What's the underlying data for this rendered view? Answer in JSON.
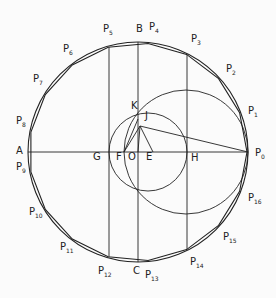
{
  "diagram": {
    "stroke_color": "#222222",
    "background": "#fbfbfb",
    "main_circle": {
      "cx": 138,
      "cy": 152,
      "r": 110
    },
    "circle_E": {
      "cx": 148,
      "cy": 152,
      "r": 39
    },
    "circle_H": {
      "cx": 186,
      "cy": 152,
      "r": 62
    },
    "points": {
      "O": [
        138,
        152
      ],
      "A": [
        28,
        152
      ],
      "P0": [
        248,
        152
      ],
      "B": [
        138,
        42
      ],
      "C": [
        138,
        262
      ],
      "G": [
        109,
        152
      ],
      "F": [
        124,
        152
      ],
      "E": [
        153,
        152
      ],
      "H": [
        187,
        152
      ],
      "J": [
        140,
        126
      ],
      "K": [
        138,
        119
      ]
    },
    "vertical_lines": [
      {
        "x": 109,
        "from": "P5",
        "to": "P12"
      },
      {
        "x": 138,
        "from": "B",
        "to": "C"
      },
      {
        "x": 187,
        "from": "P3",
        "to": "P14"
      }
    ],
    "segments": [
      [
        "A",
        "P0"
      ],
      [
        "J",
        "P0"
      ],
      [
        "J",
        "F"
      ],
      [
        "J",
        "E"
      ],
      [
        "K",
        "F"
      ],
      [
        "J",
        "O"
      ]
    ],
    "labels": {
      "A": "A",
      "B": "B",
      "C": "C",
      "O": "O",
      "E": "E",
      "F": "F",
      "G": "G",
      "H": "H",
      "J": "J",
      "K": "K",
      "vertices": [
        "P",
        "P",
        "P",
        "P",
        "P",
        "P",
        "P",
        "P",
        "P",
        "P",
        "P",
        "P",
        "P",
        "P",
        "P",
        "P",
        "P"
      ],
      "vertex_subs": [
        "0",
        "1",
        "2",
        "3",
        "4",
        "5",
        "6",
        "7",
        "8",
        "9",
        "10",
        "11",
        "12",
        "13",
        "14",
        "15",
        "16"
      ]
    }
  }
}
